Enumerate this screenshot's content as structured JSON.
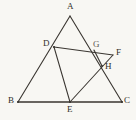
{
  "figure": {
    "background_color": "#f8f7f3",
    "stroke_color": "#3a3631",
    "label_color": "#332f2b",
    "canvas": {
      "width": 136,
      "height": 120
    },
    "points": [
      {
        "id": "A",
        "label": "A",
        "x": 70,
        "y": 16,
        "label_x": 67,
        "label_y": 2,
        "role": "apex-vertex"
      },
      {
        "id": "B",
        "label": "B",
        "x": 18,
        "y": 102,
        "label_x": 8,
        "label_y": 96,
        "role": "base-left-vertex"
      },
      {
        "id": "C",
        "label": "C",
        "x": 122,
        "y": 102,
        "label_x": 124,
        "label_y": 96,
        "role": "base-right-vertex"
      },
      {
        "id": "D",
        "label": "D",
        "x": 54,
        "y": 47,
        "label_x": 43,
        "label_y": 39,
        "role": "point-on-AB"
      },
      {
        "id": "E",
        "label": "E",
        "x": 70,
        "y": 102,
        "label_x": 67,
        "label_y": 105,
        "role": "point-on-BC"
      },
      {
        "id": "F",
        "label": "F",
        "x": 113,
        "y": 55,
        "label_x": 116,
        "label_y": 48,
        "role": "outer-point"
      },
      {
        "id": "G",
        "label": "G",
        "x": 94,
        "y": 50,
        "label_x": 93,
        "label_y": 40,
        "role": "intersection-on-AC"
      },
      {
        "id": "H",
        "label": "H",
        "x": 102,
        "y": 66,
        "label_x": 105,
        "label_y": 62,
        "role": "intersection-point"
      }
    ],
    "segments": [
      {
        "id": "AB",
        "from": "A",
        "to": "B",
        "note": "left side of triangle ABC, passes through D"
      },
      {
        "id": "AC",
        "from": "A",
        "to": "C",
        "note": "right side of triangle ABC, passes through G"
      },
      {
        "id": "BC",
        "from": "B",
        "to": "C",
        "note": "base of triangle ABC, passes through E"
      },
      {
        "id": "DE",
        "from": "D",
        "to": "E",
        "note": "cevian from D to base point E"
      },
      {
        "id": "DF",
        "from": "D",
        "to": "F",
        "note": "segment from D through G to F"
      },
      {
        "id": "EF",
        "from": "E",
        "to": "F",
        "note": "segment from E through H to F"
      },
      {
        "id": "GH",
        "from": "G",
        "to": "H",
        "note": "short segment joining G and H"
      }
    ]
  }
}
